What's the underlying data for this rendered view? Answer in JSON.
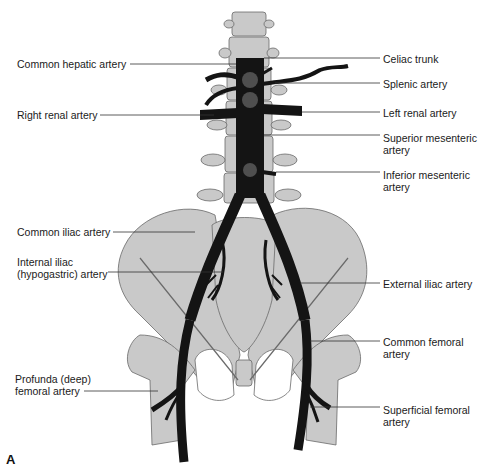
{
  "figure": {
    "panel_letter": "A",
    "colors": {
      "bone": "#c9c9c9",
      "bone_outline": "#6a6a6a",
      "artery": "#141414",
      "leader": "#333333",
      "background": "#ffffff"
    }
  },
  "labels_left": [
    {
      "id": "common-hepatic",
      "text": "Common hepatic artery"
    },
    {
      "id": "right-renal",
      "text": "Right renal artery"
    },
    {
      "id": "common-iliac",
      "text": "Common iliac artery"
    },
    {
      "id": "internal-iliac-1",
      "text": "Internal iliac"
    },
    {
      "id": "internal-iliac-2",
      "text": "(hypogastric) artery"
    },
    {
      "id": "profunda-1",
      "text": "Profunda (deep)"
    },
    {
      "id": "profunda-2",
      "text": "femoral artery"
    }
  ],
  "labels_right": [
    {
      "id": "celiac",
      "text": "Celiac trunk"
    },
    {
      "id": "splenic",
      "text": "Splenic artery"
    },
    {
      "id": "left-renal",
      "text": "Left renal artery"
    },
    {
      "id": "sma-1",
      "text": "Superior mesenteric"
    },
    {
      "id": "sma-2",
      "text": "artery"
    },
    {
      "id": "ima-1",
      "text": "Inferior mesenteric"
    },
    {
      "id": "ima-2",
      "text": "artery"
    },
    {
      "id": "external-iliac",
      "text": "External iliac artery"
    },
    {
      "id": "common-femoral-1",
      "text": "Common femoral"
    },
    {
      "id": "common-femoral-2",
      "text": "artery"
    },
    {
      "id": "superficial-femoral-1",
      "text": "Superficial femoral"
    },
    {
      "id": "superficial-femoral-2",
      "text": "artery"
    }
  ]
}
